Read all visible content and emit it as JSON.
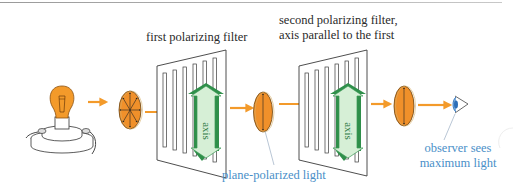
{
  "figure": {
    "labels": {
      "first_filter": "first polarizing filter",
      "second_filter_line1": "second polarizing filter,",
      "second_filter_line2": "axis parallel to the first",
      "plane_polarized": "plane-polarized light",
      "observer_line1": "observer sees",
      "observer_line2": "maximum light",
      "axis_1": "axis",
      "axis_2": "axis"
    },
    "elements": [
      {
        "id": "light-bulb",
        "kind": "light source"
      },
      {
        "id": "unpolarized-disk",
        "kind": "unpolarized light (arrows in all directions)"
      },
      {
        "id": "filter-1",
        "kind": "polarizing filter",
        "axis": "vertical"
      },
      {
        "id": "polarized-disk-1",
        "kind": "plane-polarized light (vertical)"
      },
      {
        "id": "filter-2",
        "kind": "polarizing filter",
        "axis": "vertical, parallel to first"
      },
      {
        "id": "polarized-disk-2",
        "kind": "plane-polarized light (vertical)"
      },
      {
        "id": "eye",
        "kind": "observer"
      }
    ],
    "colors": {
      "light_orange": "#f39a2a",
      "disk_orange": "#f0902a",
      "axis_green_light": "#d6efd6",
      "axis_green_dark": "#2f8f4a",
      "label_blue": "#4a8fc8",
      "eye_blue": "#2e6fb8",
      "filter_stroke": "#3a3a3a"
    }
  }
}
